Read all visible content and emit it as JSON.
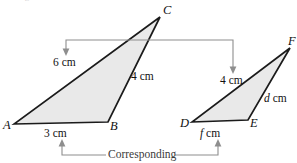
{
  "figure": {
    "clipped_caption": "the figure",
    "fill_color": "#e9e9e9",
    "stroke_color": "#1b1b1b",
    "annotation_color": "#8e8e8e"
  },
  "triangles": [
    {
      "name": "triangle-abc",
      "vertices": [
        {
          "label": "A",
          "x": 14,
          "y": 124
        },
        {
          "label": "B",
          "x": 108,
          "y": 122
        },
        {
          "label": "C",
          "x": 160,
          "y": 17
        }
      ]
    },
    {
      "name": "triangle-def",
      "vertices": [
        {
          "label": "D",
          "x": 192,
          "y": 122
        },
        {
          "label": "E",
          "x": 248,
          "y": 120
        },
        {
          "label": "F",
          "x": 290,
          "y": 48
        }
      ]
    }
  ],
  "vertex_labels": {
    "a": "A",
    "b": "B",
    "c": "C",
    "d": "D",
    "e": "E",
    "f": "F"
  },
  "measures": {
    "ac": "6 cm",
    "bc": "4 cm",
    "ab": "3 cm",
    "df_value": "4 cm",
    "ef_var": "d",
    "ef_unit": " cm",
    "de_var": "f",
    "de_unit": " cm"
  },
  "annotations": {
    "corresponding_label": "Corresponding",
    "top_bracket_from": "6 cm",
    "top_bracket_to": "4 cm",
    "bottom_bracket_from": "3 cm",
    "bottom_bracket_to": "f cm"
  }
}
